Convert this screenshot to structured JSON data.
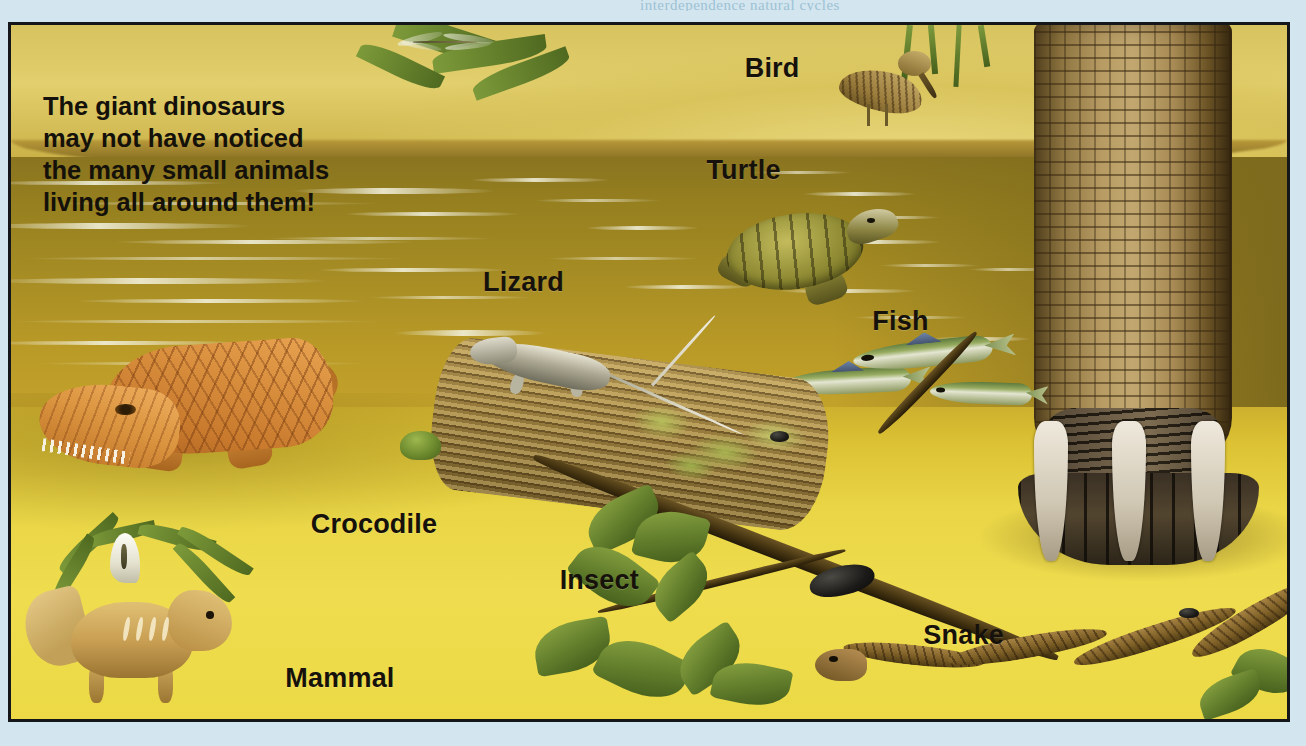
{
  "page": {
    "background_color": "#d3e6ef",
    "running_head_text": "interdependence    natural cycles"
  },
  "plate": {
    "border_color": "#14161a",
    "caption": "The giant dinosaurs may not have noticed the many small animals living all around them!"
  },
  "labels": [
    {
      "name": "bird",
      "text": "Bird",
      "left": "57.5%",
      "top": "4.0%"
    },
    {
      "name": "turtle",
      "text": "Turtle",
      "left": "54.5%",
      "top": "18.8%"
    },
    {
      "name": "lizard",
      "text": "Lizard",
      "left": "37.0%",
      "top": "34.8%"
    },
    {
      "name": "fish",
      "text": "Fish",
      "left": "67.5%",
      "top": "40.5%"
    },
    {
      "name": "crocodile",
      "text": "Crocodile",
      "left": "23.5%",
      "top": "69.8%"
    },
    {
      "name": "insect",
      "text": "Insect",
      "left": "43.0%",
      "top": "77.8%"
    },
    {
      "name": "snake",
      "text": "Snake",
      "left": "71.5%",
      "top": "85.8%"
    },
    {
      "name": "mammal",
      "text": "Mammal",
      "left": "21.5%",
      "top": "92.0%"
    }
  ],
  "scene": {
    "title": "Prehistoric riverbank with small animals and a dinosaur leg",
    "elements": [
      "dinosaur-leg",
      "crocodile",
      "lizard",
      "log",
      "turtle",
      "fish",
      "bird",
      "snake",
      "mammal",
      "insect",
      "frog",
      "dragonfly",
      "oak-leaves",
      "ferns",
      "arum-flower"
    ],
    "colors": {
      "water": "#a78d24",
      "sand": "#ecd945",
      "far_bank": "#dcc75f",
      "crocodile": "#d98f3e",
      "turtle_shell": "#8e8a33",
      "dinosaur_leg": "#b79b63",
      "foliage": "#5f7b2a",
      "label_text": "#16120b"
    }
  }
}
